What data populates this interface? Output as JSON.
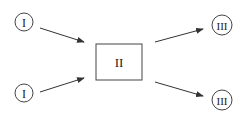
{
  "diagram": {
    "nodes": [
      {
        "id": "input-top",
        "label": "I",
        "shape": "circle",
        "cx": 24,
        "cy": 22,
        "r": 9
      },
      {
        "id": "input-bottom",
        "label": "I",
        "shape": "circle",
        "cx": 24,
        "cy": 93,
        "r": 9
      },
      {
        "id": "center-box",
        "label": "II",
        "shape": "rect",
        "x": 96,
        "y": 44,
        "w": 46,
        "h": 36
      },
      {
        "id": "output-top",
        "label": "III",
        "shape": "circle",
        "cx": 222,
        "cy": 25,
        "r": 10
      },
      {
        "id": "output-bottom",
        "label": "III",
        "shape": "circle",
        "cx": 222,
        "cy": 100,
        "r": 10
      }
    ],
    "edges": [
      {
        "from": "input-top",
        "to": "center-box"
      },
      {
        "from": "input-bottom",
        "to": "center-box"
      },
      {
        "from": "center-box",
        "to": "output-top"
      },
      {
        "from": "center-box",
        "to": "output-bottom"
      }
    ],
    "colors": {
      "stroke": "#333333",
      "text": "#222222",
      "background": "#ffffff"
    }
  }
}
